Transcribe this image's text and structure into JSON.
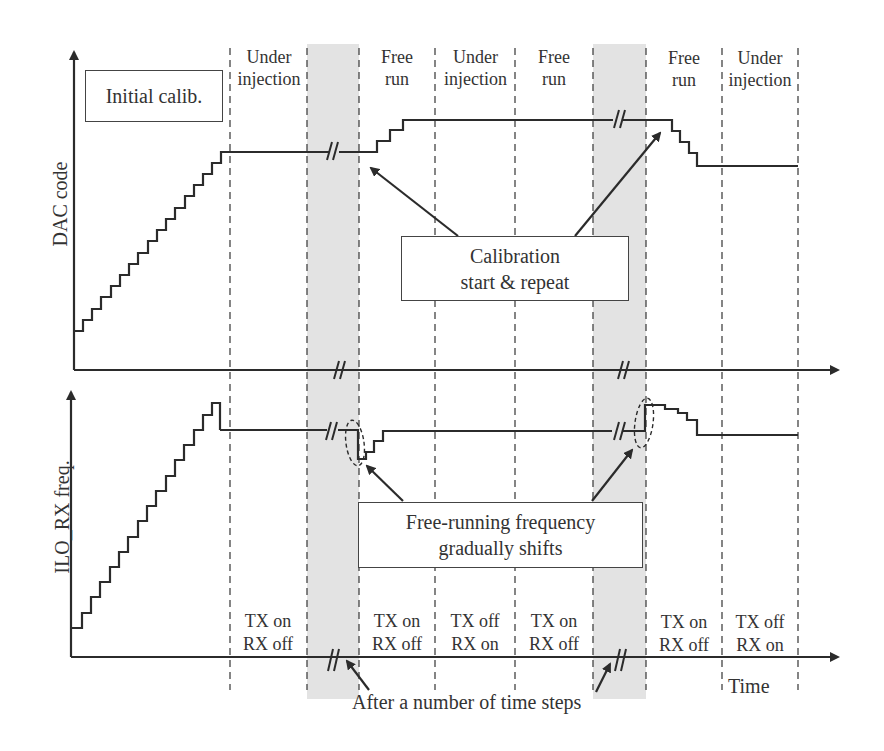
{
  "figure": {
    "type": "timing-diagram",
    "top_plot": {
      "ylabel": "DAC code",
      "annotation_box": "Initial calib."
    },
    "bottom_plot": {
      "ylabel": "ILO_RX freq.",
      "xlabel": "Time"
    },
    "phases": [
      {
        "line1": "Under",
        "line2": "injection"
      },
      {
        "line1": "Free",
        "line2": "run"
      },
      {
        "line1": "Under",
        "line2": "injection"
      },
      {
        "line1": "Free",
        "line2": "run"
      },
      {
        "line1": "Free",
        "line2": "run"
      },
      {
        "line1": "Under",
        "line2": "injection"
      }
    ],
    "states": [
      {
        "line1": "TX on",
        "line2": "RX off"
      },
      {
        "line1": "TX on",
        "line2": "RX off"
      },
      {
        "line1": "TX off",
        "line2": "RX on"
      },
      {
        "line1": "TX on",
        "line2": "RX off"
      },
      {
        "line1": "TX on",
        "line2": "RX off"
      },
      {
        "line1": "TX off",
        "line2": "RX on"
      }
    ],
    "callouts": {
      "calibration_line1": "Calibration",
      "calibration_line2": "start & repeat",
      "freq_shift_line1": "Free-running frequency",
      "freq_shift_line2": "gradually shifts",
      "time_steps": "After a number of time steps"
    },
    "colors": {
      "line": "#2b2b2b",
      "gap_band": "#e3e3e3",
      "dashed": "#444444"
    }
  }
}
